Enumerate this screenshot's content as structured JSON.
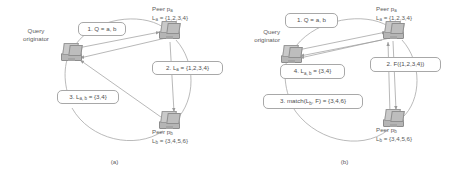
{
  "figure": {
    "panels": [
      {
        "id": "a",
        "caption": "(a)",
        "nodes": [
          {
            "name": "query-originator",
            "label_line1": "Query",
            "label_line2": "originator"
          },
          {
            "name": "peer-a",
            "label_line1": "Peer p",
            "label_sub1": "a",
            "label_line2": "L",
            "label_sub2": "a",
            "label_line2_rest": " = {1,2,3,4}"
          },
          {
            "name": "peer-b",
            "label_line1": "Peer p",
            "label_sub1": "b",
            "label_line2": "L",
            "label_sub2": "b",
            "label_line2_rest": " = {3,4,5,6}"
          }
        ],
        "messages": [
          {
            "name": "message-1",
            "prefix": "1. Q = a, b"
          },
          {
            "name": "message-2",
            "prefix": "2. L",
            "sub": "a",
            "rest": " = {1,2,3,4}"
          },
          {
            "name": "message-3",
            "prefix": "3. L",
            "sub": "a, b",
            "rest": " = {3,4}"
          }
        ]
      },
      {
        "id": "b",
        "caption": "(b)",
        "nodes": [
          {
            "name": "query-originator",
            "label_line1": "Query",
            "label_line2": "originator"
          },
          {
            "name": "peer-a",
            "label_line1": "Peer p",
            "label_sub1": "a",
            "label_line2": "L",
            "label_sub2": "a",
            "label_line2_rest": " = {1,2,3,4}"
          },
          {
            "name": "peer-b",
            "label_line1": "Peer p",
            "label_sub1": "b",
            "label_line2": "L",
            "label_sub2": "b",
            "label_line2_rest": " = {3,4,5,6}"
          }
        ],
        "messages": [
          {
            "name": "message-1",
            "prefix": "1. Q = a, b"
          },
          {
            "name": "message-2",
            "prefix": "2. F({1,2,3,4})"
          },
          {
            "name": "message-3",
            "prefix": "3. match(L",
            "sub": "b",
            "rest": ", F) = {3,4,6}"
          },
          {
            "name": "message-4",
            "prefix": "4. L",
            "sub": "a, b",
            "rest": " = {3,4}"
          }
        ]
      }
    ],
    "colors": {
      "stroke": "#a0a0a0",
      "text": "#5d5d5d",
      "box_border": "#a8a8a8",
      "background": "#ffffff"
    }
  }
}
